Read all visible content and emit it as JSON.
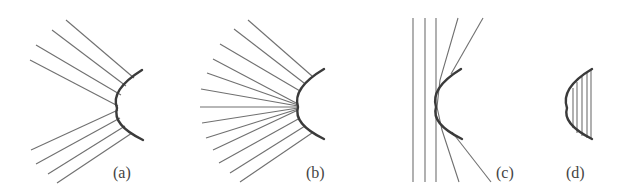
{
  "figure": {
    "panels": [
      {
        "id": "a",
        "label": "(a)",
        "description": "Rays converging on a convex mirror"
      },
      {
        "id": "b",
        "label": "(b)",
        "description": "Rays converging toward a focal point in front of a convex mirror"
      },
      {
        "id": "c",
        "label": "(c)",
        "description": "Parallel rays and reflected rays at a convex mirror"
      },
      {
        "id": "d",
        "label": "(d)",
        "description": "Convex mirror with hatched interior"
      }
    ],
    "colors": {
      "ray": "#707070",
      "mirror": "#3a3a3a",
      "label": "#444444",
      "background": "#ffffff"
    }
  }
}
